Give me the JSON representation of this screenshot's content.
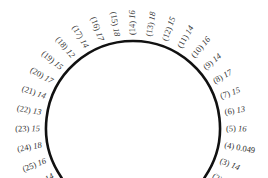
{
  "diagram": {
    "type": "tunnel-arch-measurement-points",
    "arc": {
      "color": "#111111",
      "stroke_width": 2.6
    },
    "text_color": "#333333",
    "points": [
      {
        "id": "(2)",
        "value": "13"
      },
      {
        "id": "(3)",
        "value": "14"
      },
      {
        "id": "(4)",
        "value": "0.049"
      },
      {
        "id": "(5)",
        "value": "16"
      },
      {
        "id": "(6)",
        "value": "13"
      },
      {
        "id": "(7)",
        "value": "15"
      },
      {
        "id": "(8)",
        "value": "17"
      },
      {
        "id": "(9)",
        "value": "14"
      },
      {
        "id": "(10)",
        "value": "16"
      },
      {
        "id": "(11)",
        "value": "14"
      },
      {
        "id": "(12)",
        "value": "15"
      },
      {
        "id": "(13)",
        "value": "18"
      },
      {
        "id": "(14)",
        "value": "16"
      },
      {
        "id": "(15)",
        "value": "18"
      },
      {
        "id": "(16)",
        "value": "17"
      },
      {
        "id": "(17)",
        "value": "14"
      },
      {
        "id": "(18)",
        "value": "12"
      },
      {
        "id": "(19)",
        "value": "15"
      },
      {
        "id": "(20)",
        "value": "17"
      },
      {
        "id": "(21)",
        "value": "14"
      },
      {
        "id": "(22)",
        "value": "13"
      },
      {
        "id": "(23)",
        "value": "15"
      },
      {
        "id": "(24)",
        "value": "18"
      },
      {
        "id": "(25)",
        "value": "16"
      },
      {
        "id": "(26)",
        "value": "14"
      }
    ]
  }
}
